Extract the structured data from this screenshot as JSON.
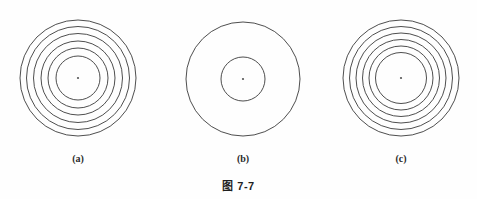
{
  "figure": {
    "caption": "图 7-7",
    "background_color": "#fefefe",
    "stroke_color": "#3a3a3a",
    "center_dot_color": "#555555"
  },
  "panels": [
    {
      "id": "panel-a",
      "label": "(a)",
      "name": "concentric-circles-a",
      "center": {
        "x": 78,
        "y": 78
      },
      "center_dot_radius": 1.1,
      "circle_count": 6,
      "radii": [
        58,
        51.5,
        44.5,
        37,
        30,
        22
      ],
      "stroke_width": 0.9
    },
    {
      "id": "panel-b",
      "label": "(b)",
      "name": "concentric-circles-b",
      "center": {
        "x": 243,
        "y": 79
      },
      "center_dot_radius": 1.1,
      "circle_count": 2,
      "radii": [
        57,
        22
      ],
      "stroke_width": 0.9
    },
    {
      "id": "panel-c",
      "label": "(c)",
      "name": "concentric-circles-c",
      "center": {
        "x": 401,
        "y": 78
      },
      "center_dot_radius": 1.1,
      "circle_count": 6,
      "radii": [
        58,
        51.5,
        45,
        38.5,
        32,
        25.5
      ],
      "stroke_width": 0.9
    }
  ]
}
